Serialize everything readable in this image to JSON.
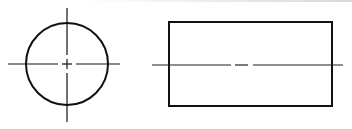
{
  "drawing": {
    "title": "",
    "stroke_color": "#111111",
    "background": "#ffffff",
    "views": [
      {
        "name": "end-view",
        "shape": "circle",
        "center": [
          67,
          64
        ],
        "radius": 41,
        "centerlines": {
          "horizontal": {
            "x1": 8,
            "x2": 120,
            "y": 64
          },
          "vertical": {
            "x": 67,
            "y1": 8,
            "y2": 122
          }
        }
      },
      {
        "name": "side-view",
        "shape": "rectangle",
        "x": 169,
        "y": 22,
        "width": 163,
        "height": 84,
        "centerline": {
          "x1": 152,
          "x2": 343,
          "y": 65
        }
      }
    ]
  }
}
